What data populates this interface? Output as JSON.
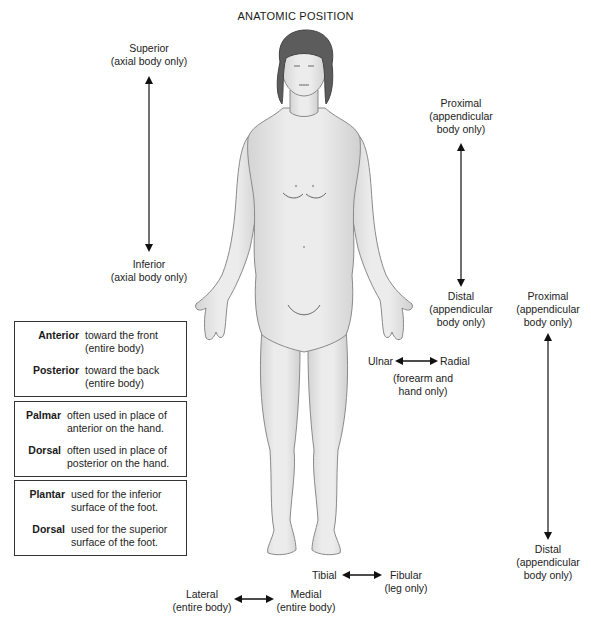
{
  "title": "ANATOMIC POSITION",
  "labels": {
    "superior": {
      "term": "Superior",
      "note": "(axial body only)"
    },
    "inferior": {
      "term": "Inferior",
      "note": "(axial body only)"
    },
    "proximal_upper": {
      "term": "Proximal",
      "note1": "(appendicular",
      "note2": "body only)"
    },
    "distal_upper": {
      "term": "Distal",
      "note1": "(appendicular",
      "note2": "body only)"
    },
    "proximal_lower": {
      "term": "Proximal",
      "note1": "(appendicular",
      "note2": "body only)"
    },
    "distal_lower": {
      "term": "Distal",
      "note1": "(appendicular",
      "note2": "body only)"
    },
    "ulnar": "Ulnar",
    "radial": "Radial",
    "forearm_note1": "(forearm and",
    "forearm_note2": "hand only)",
    "tibial": "Tibial",
    "fibular": {
      "term": "Fibular",
      "note": "(leg only)"
    },
    "lateral": {
      "term": "Lateral",
      "note": "(entire body)"
    },
    "medial": {
      "term": "Medial",
      "note": "(entire body)"
    }
  },
  "boxes": [
    {
      "rows": [
        {
          "term": "Anterior",
          "line1": "toward the front",
          "line2": "(entire body)"
        },
        {
          "term": "Posterior",
          "line1": "toward the back",
          "line2": "(entire body)"
        }
      ]
    },
    {
      "rows": [
        {
          "term": "Palmar",
          "line1": "often used in place of",
          "line2": "anterior on the hand."
        },
        {
          "term": "Dorsal",
          "line1": "often used in place of",
          "line2": "posterior on the hand."
        }
      ]
    },
    {
      "rows": [
        {
          "term": "Plantar",
          "line1": "used for the inferior",
          "line2": "surface of the foot."
        },
        {
          "term": "Dorsal",
          "line1": "used for the superior",
          "line2": "surface of the foot."
        }
      ]
    }
  ],
  "colors": {
    "skin": "#e6e6e6",
    "skin_outline": "#8a8a8a",
    "hair": "#5c5c5c",
    "arrow": "#111111"
  }
}
